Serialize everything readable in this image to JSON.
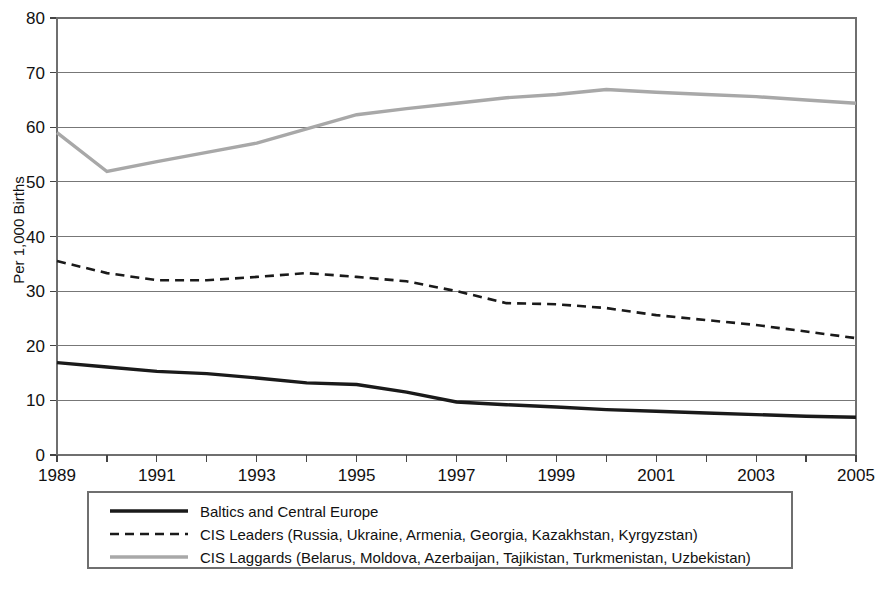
{
  "chart_data": {
    "type": "line",
    "title": "",
    "subtitle": "",
    "xlabel": "",
    "ylabel": "Per 1,000 Births",
    "ylim": [
      0,
      80
    ],
    "xlim": [
      1989,
      2005
    ],
    "ytick_step": 10,
    "yticks": [
      "0",
      "10",
      "20",
      "30",
      "40",
      "50",
      "60",
      "70",
      "80"
    ],
    "ytick_values": [
      0,
      10,
      20,
      30,
      40,
      50,
      60,
      70,
      80
    ],
    "xticks": [
      "1989",
      "1991",
      "1993",
      "1995",
      "1997",
      "1999",
      "2001",
      "2003",
      "2005"
    ],
    "xtick_values": [
      1989,
      1991,
      1993,
      1995,
      1997,
      1999,
      2001,
      2003,
      2005
    ],
    "x": [
      1989,
      1990,
      1991,
      1992,
      1993,
      1994,
      1995,
      1996,
      1997,
      1998,
      1999,
      2000,
      2001,
      2002,
      2003,
      2004,
      2005
    ],
    "grid": true,
    "grid_axis": "y",
    "legend_position": "bottom",
    "series": [
      {
        "name": "Baltics and Central Europe",
        "style": "solid",
        "color": "#1a1a1a",
        "width": 3.4,
        "values": [
          16.9,
          16.1,
          15.3,
          14.9,
          14.1,
          13.2,
          12.9,
          11.5,
          9.7,
          9.2,
          8.8,
          8.3,
          8.0,
          7.7,
          7.4,
          7.1,
          6.9
        ]
      },
      {
        "name": "CIS Leaders (Russia, Ukraine, Armenia, Georgia, Kazakhstan, Kyrgyzstan)",
        "style": "dashed",
        "color": "#1a1a1a",
        "width": 2.6,
        "dash": "9,6",
        "values": [
          35.5,
          33.3,
          32.0,
          32.0,
          32.6,
          33.3,
          32.6,
          31.8,
          30.0,
          27.8,
          27.6,
          26.9,
          25.6,
          24.7,
          23.8,
          22.6,
          21.4
        ]
      },
      {
        "name": "CIS Laggards (Belarus, Moldova, Azerbaijan, Tajikistan, Turkmenistan, Uzbekistan)",
        "style": "solid",
        "color": "#a8a8a8",
        "width": 3.4,
        "values": [
          59.0,
          51.9,
          53.7,
          55.4,
          57.1,
          59.7,
          62.3,
          63.4,
          64.4,
          65.4,
          66.0,
          66.9,
          66.4,
          66.0,
          65.6,
          65.0,
          64.4
        ]
      }
    ]
  },
  "legend": {
    "entries": [
      {
        "label": "Baltics and Central Europe",
        "swatch": "solid-black-line"
      },
      {
        "label": "CIS Leaders (Russia, Ukraine, Armenia, Georgia, Kazakhstan, Kyrgyzstan)",
        "swatch": "dashed-black-line"
      },
      {
        "label": "CIS Laggards (Belarus, Moldova, Azerbaijan, Tajikistan, Turkmenistan, Uzbekistan)",
        "swatch": "solid-gray-line"
      }
    ]
  },
  "colors": {
    "baltics": "#1a1a1a",
    "cis_leaders": "#1a1a1a",
    "cis_laggards": "#a8a8a8",
    "grid": "#777777",
    "frame": "#6f6f6f",
    "background": "#ffffff"
  }
}
